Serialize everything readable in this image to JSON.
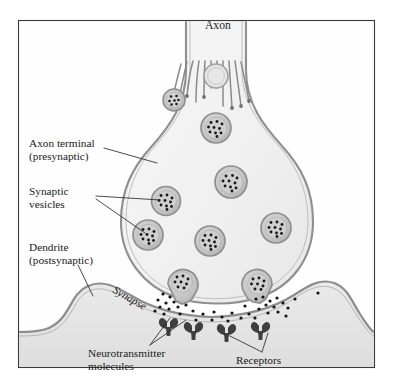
{
  "figure": {
    "background_color": "#ffffff",
    "frame_color": "#3a3a3a",
    "membrane_color": "#8f8f8f",
    "cytoplasm_color": "#f2f2f2",
    "vesicle_ring_color": "#9a9a9a",
    "vesicle_fill_color": "#c9c9c9",
    "neurotransmitter_color": "#1a1a1a",
    "receptor_color": "#4a4a4a"
  },
  "labels": {
    "axon": "Axon",
    "axon_terminal_line1": "Axon terminal",
    "axon_terminal_line2": "(presynaptic)",
    "synaptic_vesicles_line1": "Synaptic",
    "synaptic_vesicles_line2": "vesicles",
    "dendrite_line1": "Dendrite",
    "dendrite_line2": "(postsynaptic)",
    "synapse": "Synapse",
    "neurotransmitter_line1": "Neurotransmitter",
    "neurotransmitter_line2": "molecules",
    "receptors": "Receptors"
  },
  "diagram_data": {
    "type": "biological-diagram",
    "subject": "chemical synapse between an axon terminal and a dendrite",
    "structures": [
      {
        "name": "axon",
        "role": "conducts action potential into the terminal"
      },
      {
        "name": "axon-terminal",
        "role": "presynaptic bouton containing vesicles"
      },
      {
        "name": "microtubules",
        "count": 11,
        "role": "cytoskeletal transport tracks in axon"
      },
      {
        "name": "synaptic-vesicles",
        "count": 12,
        "role": "store neurotransmitter molecules"
      },
      {
        "name": "fusing-vesicles",
        "count": 2,
        "role": "exocytosis at the presynaptic membrane"
      },
      {
        "name": "synaptic-cleft",
        "role": "gap where neurotransmitter diffuses"
      },
      {
        "name": "dendrite",
        "role": "postsynaptic cell receiving the signal"
      },
      {
        "name": "receptors",
        "count": 4,
        "role": "bind neurotransmitter on postsynaptic membrane"
      },
      {
        "name": "neurotransmitter-molecules",
        "count": 38,
        "role": "chemical messengers released into cleft"
      }
    ],
    "vesicles": [
      {
        "cx": 211,
        "cy": 77,
        "r": 11.5,
        "dots": 7
      },
      {
        "cx": 174,
        "cy": 100,
        "r": 11.0,
        "dots": 9
      },
      {
        "cx": 215,
        "cy": 127,
        "r": 14.5,
        "dots": 12
      },
      {
        "cx": 229,
        "cy": 181,
        "r": 15.5,
        "dots": 11
      },
      {
        "cx": 165,
        "cy": 200,
        "r": 14.0,
        "dots": 11
      },
      {
        "cx": 147,
        "cy": 234,
        "r": 14.5,
        "dots": 12
      },
      {
        "cx": 209,
        "cy": 240,
        "r": 14.5,
        "dots": 10
      },
      {
        "cx": 274,
        "cy": 227,
        "r": 14.5,
        "dots": 11
      },
      {
        "cx": 182,
        "cy": 281,
        "r": 14.0,
        "dots": 8
      },
      {
        "cx": 258,
        "cy": 283,
        "r": 14.0,
        "dots": 7
      }
    ],
    "receptors": [
      {
        "x": 172,
        "y": 323
      },
      {
        "x": 196,
        "y": 327
      },
      {
        "x": 228,
        "y": 329
      },
      {
        "x": 262,
        "y": 327
      }
    ]
  }
}
